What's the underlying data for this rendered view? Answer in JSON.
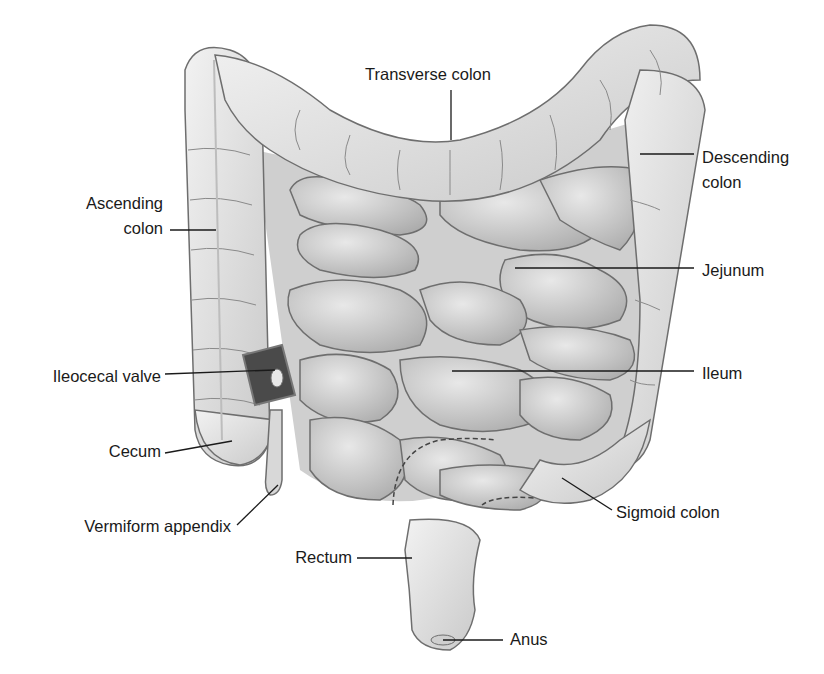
{
  "diagram": {
    "labels": {
      "transverse_colon": "Transverse colon",
      "descending_colon_l1": "Descending",
      "descending_colon_l2": "colon",
      "ascending_colon_l1": "Ascending",
      "ascending_colon_l2": "colon",
      "jejunum": "Jejunum",
      "ileocecal_valve": "Ileocecal valve",
      "ileum": "Ileum",
      "cecum": "Cecum",
      "sigmoid_colon": "Sigmoid colon",
      "vermiform_appendix": "Vermiform appendix",
      "rectum": "Rectum",
      "anus": "Anus"
    },
    "colors": {
      "background": "#ffffff",
      "organ_fill": "#e4e4e4",
      "organ_shade": "#bdbdbd",
      "outline": "#6e6e6e",
      "leader_line": "#1a1a1a",
      "text": "#1a1a1a"
    }
  }
}
